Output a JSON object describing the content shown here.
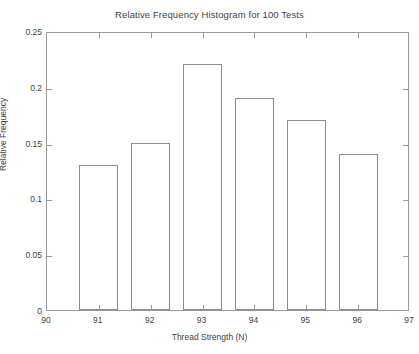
{
  "chart_data": {
    "type": "bar",
    "title": "Relative Frequency Histogram for 100 Tests",
    "xlabel": "Thread Strength (N)",
    "ylabel": "Relative Frequency",
    "categories": [
      "91",
      "92",
      "93",
      "94",
      "95",
      "96"
    ],
    "values": [
      0.13,
      0.15,
      0.22,
      0.19,
      0.17,
      0.14
    ],
    "bin_centers": [
      91,
      92,
      93,
      94,
      95,
      96
    ],
    "bar_width": 0.75,
    "xlim": [
      90,
      97
    ],
    "ylim": [
      0,
      0.25
    ],
    "xticks": [
      90,
      91,
      92,
      93,
      94,
      95,
      96,
      97
    ],
    "xtick_labels": [
      "90",
      "91",
      "92",
      "93",
      "94",
      "95",
      "96",
      "97"
    ],
    "yticks": [
      0,
      0.05,
      0.1,
      0.15,
      0.2,
      0.25
    ],
    "ytick_labels": [
      "0",
      "0.05",
      "0.1",
      "0.15",
      "0.2",
      "0.25"
    ],
    "grid": false,
    "legend": false,
    "bar_fill_color": "#ffffff",
    "bar_edge_color": "#8d8d8d",
    "axis_color": "#9a9a9a",
    "text_color": "#3f3f3f",
    "background_color": "#ffffff"
  }
}
